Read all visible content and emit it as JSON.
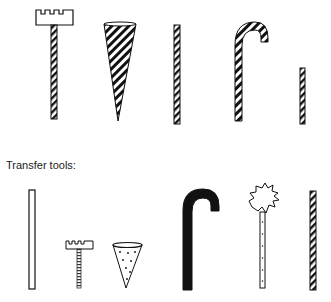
{
  "figure": {
    "section_label": "Transfer tools:",
    "colors": {
      "ink": "#111111",
      "paper": "#ffffff"
    },
    "top_row_tools": [
      {
        "id": "castle-head-striped-stick",
        "description": "Striped stick topped with a castle/crenellated block"
      },
      {
        "id": "striped-cone",
        "description": "Tall diagonally striped cone, point down"
      },
      {
        "id": "striped-stick-long",
        "description": "Long diagonally striped stick"
      },
      {
        "id": "striped-cane",
        "description": "Diagonally striped cane / hook"
      },
      {
        "id": "striped-stick-short",
        "description": "Short diagonally striped stick"
      }
    ],
    "bottom_row_tools": [
      {
        "id": "plain-stick",
        "description": "Long plain outlined stick"
      },
      {
        "id": "castle-head-ribbed-stick",
        "description": "Small castle head on a ribbed stick"
      },
      {
        "id": "dotted-cone",
        "description": "Small cone with scattered dot pattern"
      },
      {
        "id": "solid-black-cane",
        "description": "Solid black cane / hook"
      },
      {
        "id": "tuft-head-stick",
        "description": "Stick topped with a spiky tuft, dotted shaft"
      },
      {
        "id": "striped-stick-bottom",
        "description": "Diagonally striped stick"
      }
    ]
  }
}
